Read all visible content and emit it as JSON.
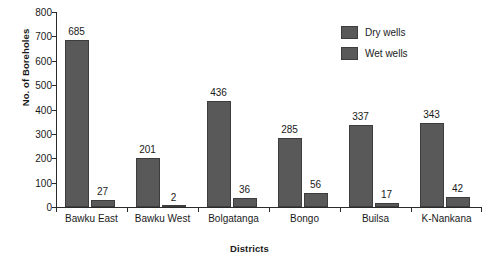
{
  "chart_data": {
    "type": "bar",
    "title": "",
    "xlabel": "Districts",
    "ylabel": "No. of Boreholes",
    "ylim": [
      0,
      800
    ],
    "ytick_step": 100,
    "yticks": [
      0,
      100,
      200,
      300,
      400,
      500,
      600,
      700,
      800
    ],
    "grid": false,
    "legend_position": "top-right",
    "categories": [
      "Bawku East",
      "Bawku West",
      "Bolgatanga",
      "Bongo",
      "Builsa",
      "K-Nankana"
    ],
    "series": [
      {
        "name": "Dry wells",
        "color": "#595959",
        "values": [
          685,
          201,
          436,
          285,
          337,
          343
        ]
      },
      {
        "name": "Wet wells",
        "color": "#595959",
        "values": [
          27,
          2,
          36,
          56,
          17,
          42
        ]
      }
    ],
    "data_labels": [
      "685",
      "27",
      "201",
      "2",
      "436",
      "36",
      "285",
      "56",
      "337",
      "17",
      "343",
      "42"
    ]
  },
  "legend": {
    "items": [
      {
        "label": "Dry wells"
      },
      {
        "label": "Wet wells"
      }
    ]
  }
}
